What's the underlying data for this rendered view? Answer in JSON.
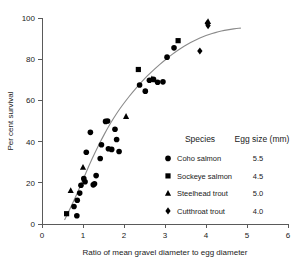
{
  "chart_data": {
    "type": "scatter",
    "title": "",
    "xlabel": "Ratio of mean gravel diameter to egg diameter",
    "ylabel": "Per cent survival",
    "xlim": [
      0,
      6
    ],
    "ylim": [
      0,
      100
    ],
    "xticks": [
      0,
      1,
      2,
      3,
      4,
      5,
      6
    ],
    "yticks": [
      0,
      20,
      40,
      60,
      80,
      100
    ],
    "xtick_labels": [
      "0",
      "1",
      "2",
      "3",
      "4",
      "5",
      "6"
    ],
    "ytick_labels": [
      "0",
      "20",
      "40",
      "60",
      "80",
      "100"
    ],
    "grid": false,
    "legend_position": "inside-lower-right",
    "legend_headers": [
      "Species",
      "Egg size (mm)"
    ],
    "series": [
      {
        "name": "Coho salmon",
        "marker": "circle",
        "egg_size_mm": "5.5",
        "color": "#000000",
        "points": [
          [
            0.78,
            8.5
          ],
          [
            0.85,
            4.0
          ],
          [
            0.86,
            11.5
          ],
          [
            0.92,
            15.0
          ],
          [
            0.95,
            18.8
          ],
          [
            1.02,
            22.0
          ],
          [
            1.05,
            20.5
          ],
          [
            1.08,
            34.8
          ],
          [
            1.18,
            44.5
          ],
          [
            1.25,
            19.0
          ],
          [
            1.28,
            19.5
          ],
          [
            1.32,
            23.5
          ],
          [
            1.42,
            31.8
          ],
          [
            1.45,
            38.5
          ],
          [
            1.55,
            49.8
          ],
          [
            1.6,
            50.0
          ],
          [
            1.62,
            36.5
          ],
          [
            1.7,
            36.2
          ],
          [
            1.78,
            46.0
          ],
          [
            1.82,
            41.0
          ],
          [
            1.88,
            35.2
          ],
          [
            2.38,
            67.5
          ],
          [
            2.52,
            64.5
          ],
          [
            2.62,
            69.8
          ],
          [
            2.72,
            70.2
          ],
          [
            2.82,
            68.8
          ],
          [
            2.95,
            69.0
          ],
          [
            3.05,
            81.0
          ],
          [
            3.22,
            85.5
          ]
        ]
      },
      {
        "name": "Sockeye salmon",
        "marker": "square",
        "egg_size_mm": "4.5",
        "color": "#000000",
        "points": [
          [
            0.6,
            5.0
          ],
          [
            2.35,
            75.0
          ],
          [
            3.32,
            89.0
          ]
        ]
      },
      {
        "name": "Steelhead trout",
        "marker": "triangle",
        "egg_size_mm": "5.0",
        "color": "#000000",
        "points": [
          [
            0.7,
            16.2
          ],
          [
            1.0,
            27.5
          ],
          [
            2.05,
            52.2
          ],
          [
            2.68,
            70.5
          ],
          [
            4.05,
            98.2
          ]
        ]
      },
      {
        "name": "Cutthroat trout",
        "marker": "diamond",
        "egg_size_mm": "4.0",
        "color": "#000000",
        "points": [
          [
            3.85,
            84.0
          ],
          [
            4.03,
            97.5
          ],
          [
            4.05,
            96.3
          ]
        ]
      }
    ],
    "fit_curve": {
      "name": "fitted sigmoid",
      "color": "#8a8a8a",
      "points": [
        [
          0.55,
          2.0
        ],
        [
          0.7,
          8.0
        ],
        [
          0.85,
          14.5
        ],
        [
          1.0,
          21.5
        ],
        [
          1.15,
          28.5
        ],
        [
          1.3,
          35.0
        ],
        [
          1.45,
          41.0
        ],
        [
          1.6,
          46.5
        ],
        [
          1.75,
          51.5
        ],
        [
          1.9,
          56.0
        ],
        [
          2.05,
          60.0
        ],
        [
          2.2,
          63.8
        ],
        [
          2.35,
          67.2
        ],
        [
          2.5,
          70.5
        ],
        [
          2.65,
          73.5
        ],
        [
          2.8,
          76.2
        ],
        [
          2.95,
          78.8
        ],
        [
          3.1,
          81.2
        ],
        [
          3.25,
          83.5
        ],
        [
          3.4,
          85.5
        ],
        [
          3.55,
          87.3
        ],
        [
          3.7,
          88.9
        ],
        [
          3.85,
          90.3
        ],
        [
          4.0,
          91.5
        ],
        [
          4.15,
          92.5
        ],
        [
          4.3,
          93.3
        ],
        [
          4.45,
          94.0
        ],
        [
          4.6,
          94.5
        ],
        [
          4.75,
          94.9
        ],
        [
          4.85,
          95.1
        ]
      ]
    }
  },
  "legend": {
    "header_species": "Species",
    "header_egg_size": "Egg size (mm)",
    "rows": [
      {
        "label": "Coho salmon",
        "egg_size": "5.5",
        "marker": "circle"
      },
      {
        "label": "Sockeye salmon",
        "egg_size": "4.5",
        "marker": "square"
      },
      {
        "label": "Steelhead trout",
        "egg_size": "5.0",
        "marker": "triangle"
      },
      {
        "label": "Cutthroat trout",
        "egg_size": "4.0",
        "marker": "diamond"
      }
    ]
  },
  "axes": {
    "x_title": "Ratio of mean gravel diameter to egg diameter",
    "y_title": "Per cent survival"
  }
}
